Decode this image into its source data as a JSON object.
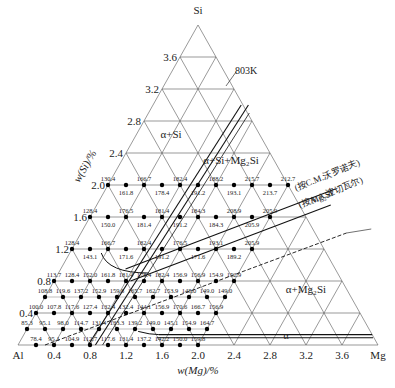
{
  "diagram": {
    "vertices": {
      "top": "Si",
      "left": "Al",
      "right": "Mg"
    },
    "x_axis_label": "w(Mg)/%",
    "y_axis_label": "w(Si)/%",
    "x_ticks": [
      "0.4",
      "0.8",
      "1.2",
      "1.6",
      "2.0",
      "2.4",
      "2.8",
      "3.2",
      "3.6"
    ],
    "y_ticks": [
      "0.4",
      "0.8",
      "1.2",
      "1.6",
      "2.0",
      "2.4",
      "2.8",
      "3.2",
      "3.6"
    ],
    "annotations": {
      "temperature": "803K",
      "region_alpha_si": "α+Si",
      "region_alpha_si_mg2si": "α+Si+Mg₂Si",
      "region_alpha_mg2si": "α+Mg₂Si",
      "region_alpha": "α",
      "line_mg2si": "Mg₂Si",
      "line_ref1": "(按C.M.沃罗诺夫)",
      "line_ref2": "(按A.A.波切瓦尔)"
    },
    "colors": {
      "grid": "#555555",
      "bold": "#111111",
      "point": "#000000",
      "text": "#222222"
    }
  },
  "data_rows": [
    {
      "si": 2.0,
      "points": [
        {
          "mg": 0.0,
          "label": "130.4",
          "pos": "above"
        },
        {
          "mg": 0.2,
          "label": "161.8",
          "pos": "below"
        },
        {
          "mg": 0.4,
          "label": "166.7",
          "pos": "above"
        },
        {
          "mg": 0.6,
          "label": "178.4",
          "pos": "below"
        },
        {
          "mg": 0.8,
          "label": "182.4",
          "pos": "above"
        },
        {
          "mg": 1.0,
          "label": "191.2",
          "pos": "below"
        },
        {
          "mg": 1.2,
          "label": "188.2",
          "pos": "above"
        },
        {
          "mg": 1.4,
          "label": "193.1",
          "pos": "below"
        },
        {
          "mg": 1.6,
          "label": "215.7",
          "pos": "above"
        },
        {
          "mg": 1.8,
          "label": "213.7",
          "pos": "below"
        },
        {
          "mg": 2.0,
          "label": "212.7",
          "pos": "above"
        }
      ]
    },
    {
      "si": 1.6,
      "points": [
        {
          "mg": 0.0,
          "label": "128.4",
          "pos": "above"
        },
        {
          "mg": 0.2,
          "label": "150.0",
          "pos": "below"
        },
        {
          "mg": 0.4,
          "label": "176.5",
          "pos": "above"
        },
        {
          "mg": 0.6,
          "label": "181.4",
          "pos": "below"
        },
        {
          "mg": 0.8,
          "label": "181.4",
          "pos": "above"
        },
        {
          "mg": 1.0,
          "label": "191.2",
          "pos": "below"
        },
        {
          "mg": 1.2,
          "label": "184.3",
          "pos": "above"
        },
        {
          "mg": 1.4,
          "label": "184.3",
          "pos": "below"
        },
        {
          "mg": 1.6,
          "label": "208.9",
          "pos": "above"
        },
        {
          "mg": 1.8,
          "label": "205.9",
          "pos": "below"
        },
        {
          "mg": 2.0,
          "label": "205.9",
          "pos": "above"
        }
      ]
    },
    {
      "si": 1.2,
      "points": [
        {
          "mg": 0.0,
          "label": "128.4",
          "pos": "above"
        },
        {
          "mg": 0.2,
          "label": "143.1",
          "pos": "below"
        },
        {
          "mg": 0.4,
          "label": "166.7",
          "pos": "above"
        },
        {
          "mg": 0.6,
          "label": "171.6",
          "pos": "below"
        },
        {
          "mg": 0.8,
          "label": "182.4",
          "pos": "above"
        },
        {
          "mg": 1.0,
          "label": "191.2",
          "pos": "below"
        },
        {
          "mg": 1.2,
          "label": "176.5",
          "pos": "above"
        },
        {
          "mg": 1.4,
          "label": "171.6",
          "pos": "below"
        },
        {
          "mg": 1.6,
          "label": "193.1",
          "pos": "above"
        },
        {
          "mg": 1.8,
          "label": "189.2",
          "pos": "below"
        },
        {
          "mg": 2.0,
          "label": "205.9",
          "pos": "above"
        }
      ]
    },
    {
      "si": 0.8,
      "points": [
        {
          "mg": 0.0,
          "label": "113.7",
          "pos": "above"
        },
        {
          "mg": 0.2,
          "label": "128.4",
          "pos": "above"
        },
        {
          "mg": 0.4,
          "label": "152.0",
          "pos": "above"
        },
        {
          "mg": 0.6,
          "label": "161.8",
          "pos": "above"
        },
        {
          "mg": 0.8,
          "label": "181.4",
          "pos": "above"
        },
        {
          "mg": 1.0,
          "label": "178.4",
          "pos": "above"
        },
        {
          "mg": 1.2,
          "label": "182.4",
          "pos": "above"
        },
        {
          "mg": 1.4,
          "label": "156.9",
          "pos": "above"
        },
        {
          "mg": 1.6,
          "label": "156.9",
          "pos": "above"
        },
        {
          "mg": 1.8,
          "label": "154.9",
          "pos": "above"
        },
        {
          "mg": 2.0,
          "label": "152.9",
          "pos": "above"
        }
      ]
    },
    {
      "si": 0.6,
      "points": [
        {
          "mg": 0.0,
          "label": "108.8"
        },
        {
          "mg": 0.2,
          "label": "119.6"
        },
        {
          "mg": 0.4,
          "label": "137.2"
        },
        {
          "mg": 0.6,
          "label": "152.9"
        },
        {
          "mg": 0.8,
          "label": "159.8"
        },
        {
          "mg": 1.0,
          "label": "165.7"
        },
        {
          "mg": 1.2,
          "label": "162.7"
        },
        {
          "mg": 1.4,
          "label": "153.9"
        },
        {
          "mg": 1.6,
          "label": "148.0"
        },
        {
          "mg": 1.8,
          "label": "149.0"
        },
        {
          "mg": 2.0,
          "label": "149.0"
        }
      ]
    },
    {
      "si": 0.4,
      "points": [
        {
          "mg": 0.0,
          "label": "100.0"
        },
        {
          "mg": 0.2,
          "label": "107.8"
        },
        {
          "mg": 0.4,
          "label": "117.6"
        },
        {
          "mg": 0.6,
          "label": "127.4"
        },
        {
          "mg": 0.8,
          "label": "132.4"
        },
        {
          "mg": 1.0,
          "label": "132.4"
        },
        {
          "mg": 1.2,
          "label": "144.1"
        },
        {
          "mg": 1.4,
          "label": "156.9"
        },
        {
          "mg": 1.6,
          "label": "170.6"
        },
        {
          "mg": 1.8,
          "label": "166.7"
        },
        {
          "mg": 2.0,
          "label": "156.9"
        }
      ]
    },
    {
      "si": 0.2,
      "points": [
        {
          "mg": 0.0,
          "label": "85.3"
        },
        {
          "mg": 0.2,
          "label": "95.1"
        },
        {
          "mg": 0.4,
          "label": "98.0"
        },
        {
          "mg": 0.6,
          "label": "114.7"
        },
        {
          "mg": 0.8,
          "label": "131.4"
        },
        {
          "mg": 1.0,
          "label": "133.3"
        },
        {
          "mg": 1.2,
          "label": "139.2"
        },
        {
          "mg": 1.4,
          "label": "149.0"
        },
        {
          "mg": 1.6,
          "label": "145.1"
        },
        {
          "mg": 1.8,
          "label": "154.9"
        },
        {
          "mg": 2.0,
          "label": "164.7"
        }
      ]
    },
    {
      "si": 0.0,
      "points": [
        {
          "mg": 0.2,
          "label": "78.4"
        },
        {
          "mg": 0.4,
          "label": "95.1"
        },
        {
          "mg": 0.6,
          "label": "104.9"
        },
        {
          "mg": 0.8,
          "label": "112.7"
        },
        {
          "mg": 1.0,
          "label": "117.6"
        },
        {
          "mg": 1.2,
          "label": "131.4"
        },
        {
          "mg": 1.4,
          "label": "137.2"
        },
        {
          "mg": 1.6,
          "label": "142.2"
        },
        {
          "mg": 1.8,
          "label": "150.0"
        },
        {
          "mg": 2.0,
          "label": "159.8"
        }
      ]
    }
  ]
}
